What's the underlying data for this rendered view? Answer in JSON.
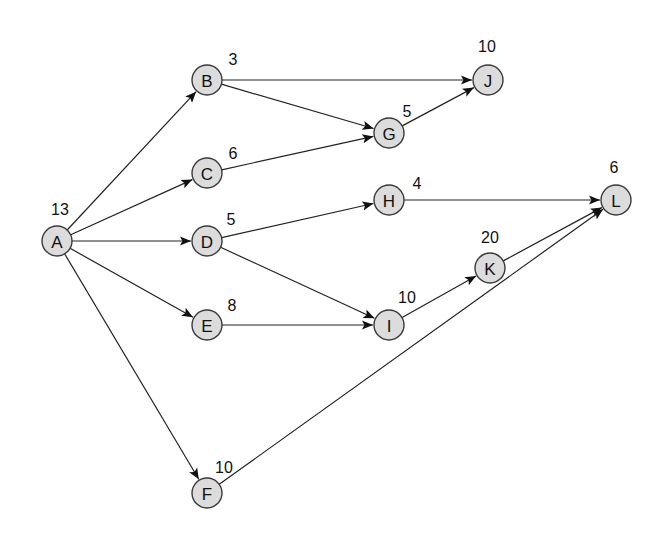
{
  "diagram": {
    "type": "activity-on-node network",
    "nodes": [
      {
        "id": "A",
        "duration": "13",
        "x": 57,
        "y": 241,
        "lx": 60,
        "ly": 209
      },
      {
        "id": "B",
        "duration": "3",
        "x": 207,
        "y": 80,
        "lx": 233,
        "ly": 59
      },
      {
        "id": "C",
        "duration": "6",
        "x": 207,
        "y": 173,
        "lx": 233,
        "ly": 153
      },
      {
        "id": "D",
        "duration": "5",
        "x": 207,
        "y": 241,
        "lx": 231,
        "ly": 219
      },
      {
        "id": "E",
        "duration": "8",
        "x": 207,
        "y": 325,
        "lx": 232,
        "ly": 305
      },
      {
        "id": "F",
        "duration": "10",
        "x": 207,
        "y": 493,
        "lx": 224,
        "ly": 467
      },
      {
        "id": "G",
        "duration": "5",
        "x": 389,
        "y": 133,
        "lx": 407,
        "ly": 111
      },
      {
        "id": "H",
        "duration": "4",
        "x": 389,
        "y": 200,
        "lx": 417,
        "ly": 183
      },
      {
        "id": "I",
        "duration": "10",
        "x": 389,
        "y": 325,
        "lx": 407,
        "ly": 297
      },
      {
        "id": "J",
        "duration": "10",
        "x": 488,
        "y": 80,
        "lx": 487,
        "ly": 46
      },
      {
        "id": "K",
        "duration": "20",
        "x": 490,
        "y": 268,
        "lx": 490,
        "ly": 237
      },
      {
        "id": "L",
        "duration": "6",
        "x": 616,
        "y": 200,
        "lx": 614,
        "ly": 167
      }
    ],
    "edges": [
      {
        "from": "A",
        "to": "B"
      },
      {
        "from": "A",
        "to": "C"
      },
      {
        "from": "A",
        "to": "D"
      },
      {
        "from": "A",
        "to": "E"
      },
      {
        "from": "A",
        "to": "F"
      },
      {
        "from": "B",
        "to": "J"
      },
      {
        "from": "B",
        "to": "G"
      },
      {
        "from": "C",
        "to": "G"
      },
      {
        "from": "G",
        "to": "J"
      },
      {
        "from": "D",
        "to": "H"
      },
      {
        "from": "D",
        "to": "I"
      },
      {
        "from": "E",
        "to": "I"
      },
      {
        "from": "H",
        "to": "L"
      },
      {
        "from": "I",
        "to": "K"
      },
      {
        "from": "K",
        "to": "L"
      },
      {
        "from": "F",
        "to": "L"
      }
    ],
    "colors": {
      "node_fill": "#dcdcdc",
      "node_stroke": "#3a3a3a",
      "edge": "#222222",
      "background": "#ffffff"
    }
  }
}
